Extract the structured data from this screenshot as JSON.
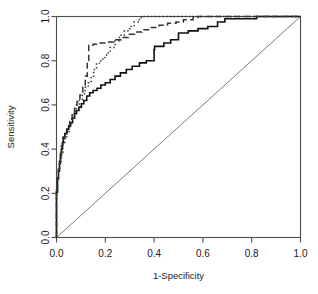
{
  "chart_data": {
    "type": "line",
    "title": "",
    "xlabel": "1-Specificity",
    "ylabel": "Sensitivity",
    "xlim": [
      0.0,
      1.0
    ],
    "ylim": [
      0.0,
      1.0
    ],
    "xticks": [
      "0.0",
      "0.2",
      "0.4",
      "0.6",
      "0.8",
      "1.0"
    ],
    "xtick_values": [
      0.0,
      0.2,
      0.4,
      0.6,
      0.8,
      1.0
    ],
    "yticks": [
      "0.0",
      "0.2",
      "0.4",
      "0.6",
      "0.8",
      "1.0"
    ],
    "ytick_values": [
      0.0,
      0.2,
      0.4,
      0.6,
      0.8,
      1.0
    ],
    "grid": false,
    "legend": "none",
    "reference_line": {
      "name": "chance-diagonal",
      "style": "solid-thin-gray",
      "x": [
        0.0,
        1.0
      ],
      "y": [
        0.0,
        1.0
      ]
    },
    "series": [
      {
        "name": "ROC curve 1",
        "style": "solid",
        "x": [
          0.0,
          0.0,
          0.004,
          0.004,
          0.008,
          0.008,
          0.012,
          0.012,
          0.016,
          0.016,
          0.02,
          0.02,
          0.024,
          0.024,
          0.028,
          0.028,
          0.034,
          0.034,
          0.042,
          0.042,
          0.05,
          0.05,
          0.058,
          0.058,
          0.066,
          0.066,
          0.074,
          0.074,
          0.082,
          0.082,
          0.092,
          0.092,
          0.102,
          0.102,
          0.112,
          0.112,
          0.124,
          0.124,
          0.136,
          0.136,
          0.15,
          0.15,
          0.166,
          0.166,
          0.182,
          0.182,
          0.2,
          0.2,
          0.22,
          0.22,
          0.24,
          0.24,
          0.262,
          0.262,
          0.286,
          0.286,
          0.31,
          0.31,
          0.34,
          0.34,
          0.368,
          0.368,
          0.4,
          0.4,
          0.402,
          0.402,
          0.44,
          0.44,
          0.468,
          0.468,
          0.5,
          0.5,
          0.54,
          0.54,
          0.58,
          0.58,
          0.62,
          0.62,
          0.66,
          0.66,
          0.69,
          0.69,
          0.82,
          0.82,
          1.0
        ],
        "y": [
          0.0,
          0.205,
          0.205,
          0.265,
          0.265,
          0.3,
          0.3,
          0.335,
          0.335,
          0.37,
          0.37,
          0.4,
          0.4,
          0.43,
          0.43,
          0.455,
          0.455,
          0.47,
          0.47,
          0.49,
          0.49,
          0.505,
          0.505,
          0.52,
          0.52,
          0.54,
          0.54,
          0.56,
          0.56,
          0.575,
          0.575,
          0.59,
          0.59,
          0.605,
          0.605,
          0.62,
          0.62,
          0.64,
          0.64,
          0.655,
          0.655,
          0.665,
          0.665,
          0.675,
          0.675,
          0.69,
          0.69,
          0.7,
          0.7,
          0.715,
          0.715,
          0.73,
          0.73,
          0.745,
          0.745,
          0.76,
          0.76,
          0.775,
          0.775,
          0.79,
          0.79,
          0.8,
          0.8,
          0.85,
          0.85,
          0.865,
          0.865,
          0.88,
          0.88,
          0.895,
          0.895,
          0.925,
          0.925,
          0.935,
          0.935,
          0.945,
          0.945,
          0.955,
          0.955,
          0.975,
          0.975,
          0.99,
          0.99,
          1.0,
          1.0
        ]
      },
      {
        "name": "ROC curve 2",
        "style": "dashed",
        "x": [
          0.0,
          0.0,
          0.004,
          0.004,
          0.008,
          0.008,
          0.012,
          0.012,
          0.016,
          0.016,
          0.02,
          0.02,
          0.026,
          0.026,
          0.034,
          0.034,
          0.044,
          0.044,
          0.054,
          0.054,
          0.064,
          0.064,
          0.074,
          0.074,
          0.084,
          0.084,
          0.096,
          0.096,
          0.108,
          0.108,
          0.118,
          0.118,
          0.126,
          0.126,
          0.132,
          0.132,
          0.15,
          0.15,
          0.175,
          0.175,
          0.205,
          0.205,
          0.235,
          0.235,
          0.265,
          0.265,
          0.295,
          0.295,
          0.32,
          0.32,
          0.35,
          0.35,
          0.385,
          0.385,
          0.42,
          0.42,
          0.455,
          0.455,
          0.49,
          0.49,
          0.52,
          0.52,
          0.56,
          0.56,
          0.58,
          0.58,
          1.0
        ],
        "y": [
          0.0,
          0.215,
          0.215,
          0.27,
          0.27,
          0.31,
          0.31,
          0.345,
          0.345,
          0.38,
          0.38,
          0.415,
          0.415,
          0.45,
          0.45,
          0.475,
          0.475,
          0.5,
          0.5,
          0.525,
          0.525,
          0.555,
          0.555,
          0.585,
          0.585,
          0.615,
          0.615,
          0.645,
          0.645,
          0.68,
          0.68,
          0.73,
          0.73,
          0.8,
          0.8,
          0.87,
          0.87,
          0.875,
          0.875,
          0.88,
          0.88,
          0.885,
          0.885,
          0.895,
          0.895,
          0.905,
          0.905,
          0.92,
          0.92,
          0.93,
          0.93,
          0.94,
          0.94,
          0.95,
          0.95,
          0.96,
          0.96,
          0.97,
          0.97,
          0.975,
          0.975,
          0.985,
          0.985,
          0.995,
          0.995,
          1.0,
          1.0
        ]
      },
      {
        "name": "ROC curve 3",
        "style": "dotted",
        "x": [
          0.0,
          0.0,
          0.004,
          0.004,
          0.008,
          0.008,
          0.014,
          0.014,
          0.02,
          0.02,
          0.026,
          0.026,
          0.034,
          0.034,
          0.042,
          0.042,
          0.052,
          0.052,
          0.062,
          0.062,
          0.072,
          0.072,
          0.082,
          0.082,
          0.094,
          0.094,
          0.106,
          0.106,
          0.118,
          0.118,
          0.13,
          0.13,
          0.142,
          0.142,
          0.152,
          0.152,
          0.164,
          0.164,
          0.176,
          0.176,
          0.19,
          0.19,
          0.205,
          0.205,
          0.22,
          0.22,
          0.24,
          0.24,
          0.258,
          0.258,
          0.278,
          0.278,
          0.3,
          0.3,
          0.318,
          0.318,
          0.34,
          0.34,
          0.352,
          0.352,
          1.0
        ],
        "y": [
          0.0,
          0.21,
          0.21,
          0.265,
          0.265,
          0.305,
          0.305,
          0.345,
          0.345,
          0.385,
          0.385,
          0.425,
          0.425,
          0.45,
          0.45,
          0.48,
          0.48,
          0.51,
          0.51,
          0.54,
          0.54,
          0.57,
          0.57,
          0.6,
          0.6,
          0.625,
          0.625,
          0.65,
          0.65,
          0.68,
          0.68,
          0.7,
          0.7,
          0.73,
          0.73,
          0.76,
          0.76,
          0.785,
          0.785,
          0.8,
          0.8,
          0.815,
          0.815,
          0.835,
          0.835,
          0.86,
          0.86,
          0.89,
          0.89,
          0.915,
          0.915,
          0.935,
          0.935,
          0.955,
          0.955,
          0.975,
          0.975,
          0.995,
          0.995,
          1.0,
          1.0
        ]
      }
    ]
  }
}
